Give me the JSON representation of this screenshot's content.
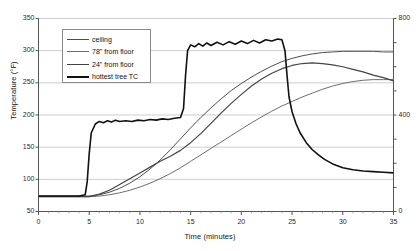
{
  "chart_data": {
    "type": "line",
    "title": "",
    "xlabel": "Time (minutes)",
    "ylabel": "Temperature (°F)",
    "ylabel_right": "",
    "xlim": [
      0,
      35
    ],
    "ylim": [
      50,
      350
    ],
    "ylim_right": [
      0,
      800
    ],
    "grid": true,
    "legend_position": "upper-left",
    "xticks": [
      "0",
      "5",
      "10",
      "15",
      "20",
      "25",
      "30",
      "35"
    ],
    "xtick_values": [
      0,
      5,
      10,
      15,
      20,
      25,
      30,
      35
    ],
    "yticks": [
      "50",
      "100",
      "150",
      "200",
      "250",
      "300",
      "350"
    ],
    "ytick_values": [
      50,
      100,
      150,
      200,
      250,
      300,
      350
    ],
    "yticks_right": [
      "0",
      "400",
      "800"
    ],
    "ytick_values_right": [
      0,
      400,
      800
    ],
    "ytick_gridlines_right": [
      0,
      100,
      200,
      300,
      400,
      500,
      600,
      700,
      800
    ],
    "series": [
      {
        "name": "ceiling",
        "color": "#4d4d4d",
        "width": 1.0,
        "x": [
          0,
          2,
          4,
          5,
          6,
          7,
          8,
          9,
          10,
          11,
          12,
          13,
          14,
          15,
          16,
          17,
          18,
          19,
          20,
          21,
          22,
          23,
          24,
          25,
          26,
          27,
          28,
          29,
          30,
          31,
          32,
          33,
          34,
          35
        ],
        "values": [
          74,
          74,
          74,
          74,
          76,
          80,
          86,
          94,
          104,
          116,
          130,
          146,
          163,
          180,
          196,
          211,
          225,
          238,
          249,
          259,
          268,
          276,
          283,
          288,
          292,
          295,
          297,
          298,
          299,
          299,
          299,
          299,
          298,
          298
        ]
      },
      {
        "name": "78\" from floor",
        "color": "#6e6e6e",
        "width": 1.0,
        "x": [
          0,
          2,
          4,
          5,
          6,
          7,
          8,
          9,
          10,
          11,
          12,
          13,
          14,
          15,
          16,
          17,
          18,
          19,
          20,
          21,
          22,
          23,
          24,
          25,
          26,
          27,
          28,
          29,
          30,
          31,
          32,
          33,
          34,
          35
        ],
        "values": [
          73,
          73,
          73,
          73,
          74,
          76,
          79,
          83,
          88,
          94,
          101,
          109,
          118,
          128,
          138,
          148,
          158,
          168,
          178,
          188,
          197,
          206,
          214,
          221,
          228,
          234,
          240,
          245,
          249,
          252,
          254,
          255,
          255,
          255
        ]
      },
      {
        "name": "24\" from floor",
        "color": "#454545",
        "width": 1.2,
        "x": [
          0,
          2,
          4,
          5,
          6,
          7,
          8,
          9,
          10,
          11,
          12,
          13,
          14,
          15,
          16,
          17,
          18,
          19,
          20,
          21,
          22,
          23,
          24,
          25,
          26,
          27,
          28,
          29,
          30,
          31,
          32,
          33,
          34,
          35
        ],
        "values": [
          73,
          73,
          73,
          73,
          77,
          83,
          92,
          101,
          110,
          119,
          128,
          136,
          145,
          157,
          171,
          187,
          203,
          218,
          232,
          245,
          256,
          265,
          272,
          277,
          280,
          281,
          280,
          278,
          275,
          271,
          267,
          262,
          258,
          253
        ]
      },
      {
        "name": "hottest tree TC",
        "color": "#111111",
        "width": 1.6,
        "x": [
          0,
          1,
          2,
          3,
          4,
          4.6,
          4.8,
          5.0,
          5.2,
          5.6,
          6.0,
          6.4,
          6.8,
          7.2,
          7.6,
          8.0,
          8.6,
          9.2,
          9.8,
          10.4,
          11.0,
          11.6,
          12.2,
          12.8,
          13.4,
          14.0,
          14.3,
          14.5,
          14.7,
          15.0,
          15.4,
          15.8,
          16.2,
          16.6,
          17.0,
          17.6,
          18.2,
          18.8,
          19.4,
          20.0,
          20.6,
          21.2,
          21.8,
          22.4,
          23.0,
          23.6,
          24.0,
          24.3,
          24.5,
          24.7,
          25.0,
          25.4,
          25.8,
          26.4,
          27.0,
          27.6,
          28.2,
          29.0,
          30.0,
          31.0,
          32.0,
          33.0,
          34.0,
          35.0
        ],
        "values": [
          74,
          74,
          74,
          74,
          74,
          76,
          96,
          140,
          172,
          186,
          190,
          188,
          191,
          189,
          192,
          190,
          191,
          190,
          192,
          191,
          193,
          192,
          194,
          193,
          195,
          196,
          210,
          262,
          300,
          309,
          306,
          311,
          307,
          312,
          308,
          313,
          309,
          314,
          310,
          315,
          311,
          316,
          312,
          317,
          315,
          318,
          317,
          300,
          262,
          228,
          205,
          186,
          172,
          157,
          146,
          138,
          131,
          124,
          118,
          115,
          113,
          112,
          111,
          110
        ]
      }
    ]
  },
  "legend": {
    "items": [
      {
        "label": "ceiling"
      },
      {
        "label": "78\" from floor"
      },
      {
        "label": "24\" from floor"
      },
      {
        "label": "hottest tree TC"
      }
    ]
  },
  "axes": {
    "x_title": "Time (minutes)",
    "y_title": "Temperature (°F)"
  }
}
